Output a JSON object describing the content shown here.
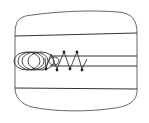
{
  "diagram": {
    "type": "line-drawing",
    "colors": {
      "background": "#ffffff",
      "stroke": "#333333",
      "node": "#222222"
    },
    "outer_body": {
      "path": "M15,34 C15,20 20,16 32,15 C60,11 95,10 118,12 C132,13 137,20 137,33 L137,88 C138,100 130,106 115,108 C90,112 55,112 32,107 C20,104 15,96 15,88 Z"
    },
    "horizontal_lines": [
      {
        "name": "upper-wall-line",
        "x1": 15,
        "y1": 36,
        "x2": 137,
        "y2": 33
      },
      {
        "name": "channel-top-line",
        "x1": 50,
        "y1": 56,
        "x2": 137,
        "y2": 56
      },
      {
        "name": "channel-bottom-line",
        "x1": 50,
        "y1": 66,
        "x2": 137,
        "y2": 66
      },
      {
        "name": "lower-wall-line",
        "x1": 15,
        "y1": 88,
        "x2": 137,
        "y2": 89
      }
    ],
    "loops": [
      {
        "cx": 27,
        "cy": 61,
        "rx": 13,
        "ry": 9
      },
      {
        "cx": 31,
        "cy": 61,
        "rx": 13,
        "ry": 9
      },
      {
        "cx": 35,
        "cy": 61,
        "rx": 13,
        "ry": 9
      },
      {
        "cx": 41,
        "cy": 61,
        "rx": 13,
        "ry": 9
      },
      {
        "cx": 54,
        "cy": 61,
        "rx": 5,
        "ry": 4
      }
    ],
    "zigzag": {
      "points": "45,58 46,68 51,54 57,69 64,52 70,69 77,52 82,69 87,59"
    },
    "nodes": [
      {
        "x": 46,
        "y": 69
      },
      {
        "x": 57,
        "y": 70
      },
      {
        "x": 64,
        "y": 52
      },
      {
        "x": 70,
        "y": 69
      },
      {
        "x": 77,
        "y": 52
      },
      {
        "x": 82,
        "y": 70
      }
    ]
  }
}
